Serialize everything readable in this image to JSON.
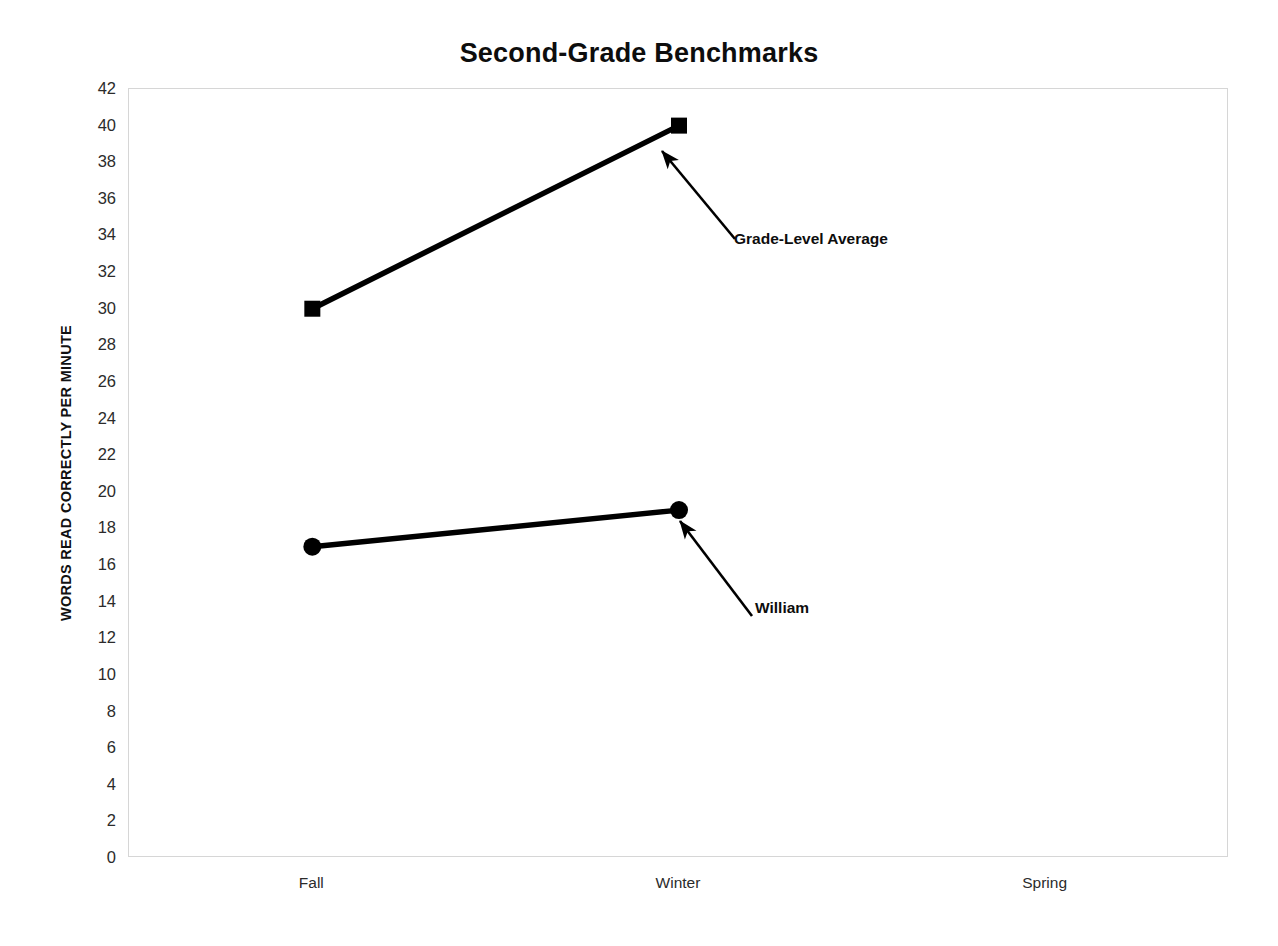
{
  "chart_data": {
    "type": "line",
    "title": "Second-Grade Benchmarks",
    "xlabel": "",
    "ylabel": "WORDS READ CORRECTLY PER MINUTE",
    "categories": [
      "Fall",
      "Winter",
      "Spring"
    ],
    "ylim": [
      0,
      42
    ],
    "ytick_step": 2,
    "yticks": [
      42,
      40,
      38,
      36,
      34,
      32,
      30,
      28,
      26,
      24,
      22,
      20,
      18,
      16,
      14,
      12,
      10,
      8,
      6,
      4,
      2,
      0
    ],
    "grid": false,
    "legend": "none",
    "series": [
      {
        "name": "Grade-Level Average",
        "marker": "square",
        "color": "#000000",
        "values": [
          30,
          40,
          null
        ]
      },
      {
        "name": "William",
        "marker": "circle",
        "color": "#000000",
        "values": [
          17,
          19,
          null
        ]
      }
    ],
    "annotations": [
      {
        "text": "Grade-Level Average",
        "points_to_series": "Grade-Level Average",
        "points_to_category": "Winter"
      },
      {
        "text": "William",
        "points_to_series": "William",
        "points_to_category": "Winter"
      }
    ]
  },
  "axis": {
    "y_labels": [
      "42",
      "40",
      "38",
      "36",
      "34",
      "32",
      "30",
      "28",
      "26",
      "24",
      "22",
      "20",
      "18",
      "16",
      "14",
      "12",
      "10",
      "8",
      "6",
      "4",
      "2",
      "0"
    ],
    "x_labels": [
      "Fall",
      "Winter",
      "Spring"
    ]
  },
  "colors": {
    "series": "#000000",
    "plot_border": "#d6d6d6",
    "text": "#0d0d0d",
    "tick_text": "#2b2b2b",
    "background": "#ffffff"
  }
}
